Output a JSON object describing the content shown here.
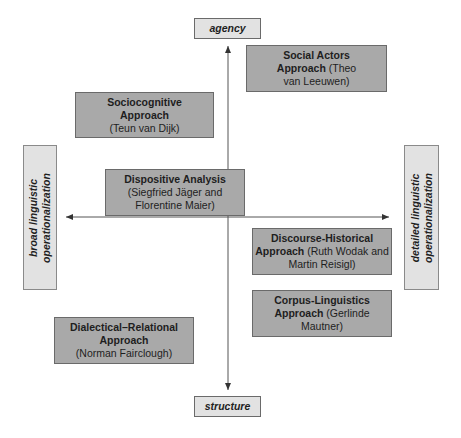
{
  "axes": {
    "top": "agency",
    "bottom": "structure",
    "left": [
      "broad linguistic",
      "operationalization"
    ],
    "right": [
      "detailed linguistic",
      "operationalization"
    ]
  },
  "approaches": {
    "social_actors": {
      "line1": "Social Actors",
      "line2_bold": "Approach",
      "line2_rest": " (Theo",
      "line3": "van Leeuwen)"
    },
    "sociocognitive": {
      "line1": "Sociocognitive",
      "line2": "Approach",
      "line3": "(Teun van Dijk)"
    },
    "dispositive": {
      "line1": "Dispositive Analysis",
      "line2": "(Siegfried Jäger and",
      "line3": "Florentine Maier)"
    },
    "discourse_historical": {
      "line1": "Discourse-Historical",
      "line2_bold": "Approach",
      "line2_rest": " (Ruth Wodak and",
      "line3": "Martin Reisigl)"
    },
    "corpus_linguistics": {
      "line1": "Corpus-Linguistics",
      "line2_bold": "Approach",
      "line2_rest": " (Gerlinde",
      "line3": "Mautner)"
    },
    "dialectical_relational": {
      "line1": "Dialectical–Relational",
      "line2": "Approach",
      "line3": "(Norman Fairclough)"
    }
  },
  "colors": {
    "approach_fill": "#a9a9a9",
    "axis_fill": "#e2e2e2",
    "line": "#555555"
  }
}
